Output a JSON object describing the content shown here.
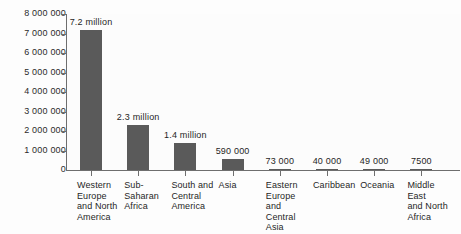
{
  "chart_data": {
    "type": "bar",
    "title": "",
    "subtitle": "",
    "xlabel": "",
    "ylabel": "",
    "ylim": [
      0,
      8000000
    ],
    "grid": false,
    "legend": "none",
    "orientation": "vertical",
    "bar_color": "#5a5a5a",
    "axis_color": "#6e6e6e",
    "background_color": "#fcfcfc",
    "categories": [
      "Western Europe and North America",
      "Sub-Saharan Africa",
      "South and Central America",
      "Asia",
      "Eastern Europe and Central Asia",
      "Caribbean",
      "Oceania",
      "Middle East and North Africa"
    ],
    "category_lines": [
      [
        "Western",
        "Europe",
        "and North",
        "America"
      ],
      [
        "Sub-",
        "Saharan",
        "Africa"
      ],
      [
        "South and",
        "Central",
        "America"
      ],
      [
        "Asia"
      ],
      [
        "Eastern",
        "Europe",
        "and",
        "Central Asia"
      ],
      [
        "Caribbean"
      ],
      [
        "Oceania"
      ],
      [
        "Middle East",
        "and North",
        "Africa"
      ]
    ],
    "values": [
      7200000,
      2300000,
      1400000,
      590000,
      73000,
      40000,
      49000,
      7500
    ],
    "data_labels": [
      "7.2 million",
      "2.3 million",
      "1.4 million",
      "590 000",
      "73 000",
      "40 000",
      "49 000",
      "7500"
    ],
    "y_ticks": [
      0,
      1000000,
      2000000,
      3000000,
      4000000,
      5000000,
      6000000,
      7000000,
      8000000
    ],
    "y_tick_labels": [
      "0",
      "1 000 000",
      "2 000 000",
      "3 000 000",
      "4 000 000",
      "5 000 000",
      "6 000 000",
      "7 000 000",
      "8 000 000"
    ]
  }
}
